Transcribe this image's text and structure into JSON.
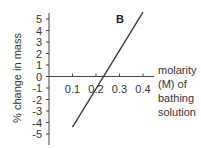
{
  "chart_data": {
    "type": "line",
    "title": "B",
    "xlabel": "molarity (M) of bathing solution",
    "ylabel": "% change in mass",
    "xlim": [
      0,
      0.4
    ],
    "ylim": [
      -5,
      5
    ],
    "x_ticks": [
      "0.1",
      "0.2",
      "0.3",
      "0.4"
    ],
    "y_ticks": [
      "5",
      "4",
      "3",
      "2",
      "1",
      "0",
      "-1",
      "-2",
      "-3",
      "-4",
      "-5"
    ],
    "grid": false,
    "series": [
      {
        "name": "B",
        "x": [
          0.1,
          0.4
        ],
        "y": [
          -4.4,
          5.6
        ]
      }
    ],
    "x_intercept": 0.23
  },
  "labels": {
    "panel": "B",
    "ylabel": "% change in mass",
    "xlabel_lines": [
      "molarity",
      "(M) of",
      "bathing",
      "solution"
    ]
  }
}
